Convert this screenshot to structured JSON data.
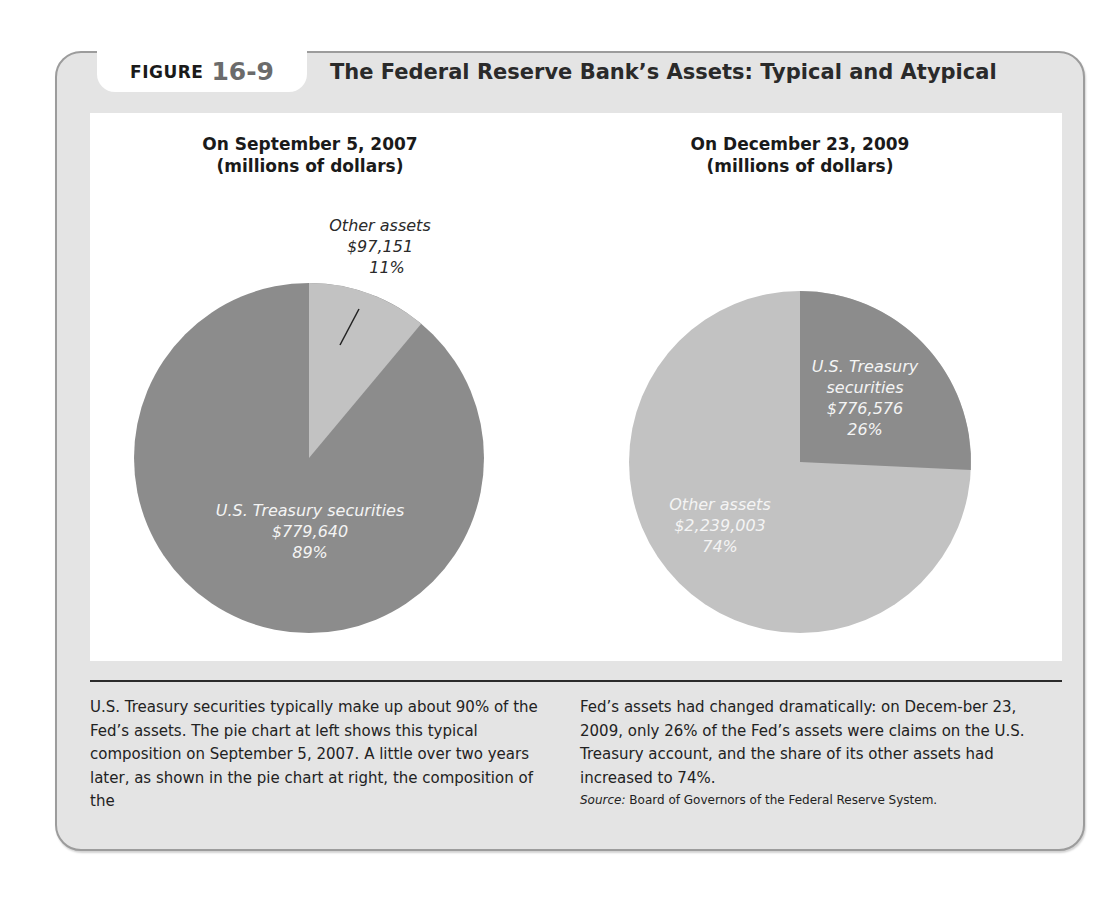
{
  "figure": {
    "label_word": "FIGURE",
    "label_number": "16-9",
    "title": "The Federal Reserve Bank’s Assets: Typical and Atypical"
  },
  "colors": {
    "frame_bg": "#e4e4e4",
    "frame_border": "#9c9c9c",
    "panel_bg": "#ffffff",
    "treasury_2007": "#8c8c8c",
    "other_2007": "#c2c2c2",
    "treasury_2009": "#8c8c8c",
    "other_2009": "#c2c2c2"
  },
  "charts": {
    "left": {
      "title_line1": "On September 5, 2007",
      "title_line2": "(millions of dollars)",
      "other": {
        "name": "Other assets",
        "value": "$97,151",
        "pct": "11%"
      },
      "treasury": {
        "name": "U.S. Treasury securities",
        "value": "$779,640",
        "pct": "89%"
      }
    },
    "right": {
      "title_line1": "On December 23, 2009",
      "title_line2": "(millions of dollars)",
      "treasury": {
        "name_line1": "U.S. Treasury",
        "name_line2": "securities",
        "value": "$776,576",
        "pct": "26%"
      },
      "other": {
        "name": "Other assets",
        "value": "$2,239,003",
        "pct": "74%"
      }
    }
  },
  "caption": {
    "left": "U.S. Treasury securities typically make up about 90% of the Fed’s assets. The pie chart at left shows this typical composition on September 5, 2007. A little over two years later, as shown in the pie chart at right, the composition of the",
    "right": "Fed’s assets had changed dramatically: on Decem-ber 23, 2009, only 26% of the Fed’s assets were claims on the U.S. Treasury account, and the share of its other assets had increased to 74%.",
    "source_label": "Source:",
    "source_text": " Board of Governors of the Federal Reserve System."
  },
  "chart_data": [
    {
      "type": "pie",
      "title": "On September 5, 2007 (millions of dollars)",
      "categories": [
        "Other assets",
        "U.S. Treasury securities"
      ],
      "values": [
        97151,
        779640
      ],
      "percentages": [
        11,
        89
      ],
      "units": "millions of dollars",
      "start_angle": "12 o'clock, clockwise",
      "legend": "inline labels"
    },
    {
      "type": "pie",
      "title": "On December 23, 2009 (millions of dollars)",
      "categories": [
        "U.S. Treasury securities",
        "Other assets"
      ],
      "values": [
        776576,
        2239003
      ],
      "percentages": [
        26,
        74
      ],
      "units": "millions of dollars",
      "start_angle": "12 o'clock, clockwise",
      "legend": "inline labels"
    }
  ]
}
